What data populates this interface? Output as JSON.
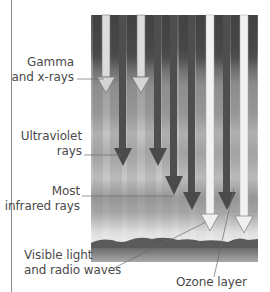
{
  "diagram": {
    "labels": {
      "gamma": [
        "Gamma",
        "and x-rays"
      ],
      "ultraviolet": [
        "Ultraviolet",
        "rays"
      ],
      "infrared": [
        "Most",
        "infrared rays"
      ],
      "visible": [
        "Visible light",
        "and radio waves"
      ],
      "ozone": "Ozone layer"
    },
    "colors": {
      "sky_dark": "#4a4a4a",
      "sky_mid": "#8c8c8c",
      "sky_light": "#d6d6d6",
      "arrow_dark": "#555555",
      "arrow_light": "#eeeeee",
      "ground": "#7a7a7a",
      "text": "#4a4a4a",
      "leader": "#6a6a6a"
    },
    "arrows": [
      {
        "type": "light",
        "name": "gamma-ray-arrow-1",
        "x": 106,
        "end_y": 93
      },
      {
        "type": "dark",
        "name": "ultraviolet-arrow-1",
        "x": 123,
        "end_y": 166
      },
      {
        "type": "light",
        "name": "gamma-ray-arrow-2",
        "x": 141,
        "end_y": 93
      },
      {
        "type": "dark",
        "name": "ultraviolet-arrow-2",
        "x": 158,
        "end_y": 166
      },
      {
        "type": "dark",
        "name": "infrared-arrow-1",
        "x": 174,
        "end_y": 195
      },
      {
        "type": "dark",
        "name": "infrared-arrow-2",
        "x": 192,
        "end_y": 210
      },
      {
        "type": "light",
        "name": "visible-radio-arrow-1",
        "x": 210,
        "end_y": 230
      },
      {
        "type": "dark",
        "name": "infrared-arrow-3",
        "x": 227,
        "end_y": 210
      },
      {
        "type": "light",
        "name": "visible-radio-arrow-2",
        "x": 244,
        "end_y": 232
      }
    ]
  }
}
